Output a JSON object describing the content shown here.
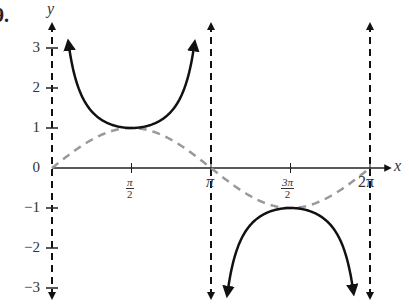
{
  "problem_label": "9.",
  "chart_data": {
    "type": "line",
    "title": "",
    "xlabel": "x",
    "ylabel": "y",
    "xlim": [
      0,
      6.2832
    ],
    "ylim": [
      -3,
      3
    ],
    "grid": false,
    "x_tick_labels": [
      "π/2",
      "π",
      "3π/2",
      "2π"
    ],
    "x_ticks": [
      1.5708,
      3.1416,
      4.7124,
      6.2832
    ],
    "y_tick_labels": [
      "-3",
      "-2",
      "-1",
      "0",
      "1",
      "2",
      "3"
    ],
    "y_ticks": [
      -3,
      -2,
      -1,
      0,
      1,
      2,
      3
    ],
    "series": [
      {
        "name": "y = csc x",
        "style": "solid black, arrows at ends",
        "branches": [
          {
            "x_range": [
              0.33,
              2.81
            ],
            "vertex": [
              1.5708,
              1
            ],
            "opens": "up"
          },
          {
            "x_range": [
              3.47,
              5.95
            ],
            "vertex": [
              4.7124,
              -1
            ],
            "opens": "down"
          }
        ]
      },
      {
        "name": "y = sin x",
        "style": "gray dashed",
        "points": [
          [
            0,
            0
          ],
          [
            1.5708,
            1
          ],
          [
            3.1416,
            0
          ],
          [
            4.7124,
            -1
          ],
          [
            6.2832,
            0
          ]
        ]
      }
    ],
    "asymptotes": [
      {
        "x": 0,
        "label": "x = 0"
      },
      {
        "x": 3.1416,
        "label": "x = π"
      },
      {
        "x": 6.2832,
        "label": "x = 2π"
      }
    ]
  },
  "labels": {
    "y_axis": "y",
    "x_axis": "x",
    "y3": "3",
    "y2": "2",
    "y1": "1",
    "y0": "0",
    "yn1": "−1",
    "yn2": "−2",
    "yn3": "−3",
    "pi_half_num": "π",
    "pi_half_den": "2",
    "pi": "π",
    "three_pi_half_num": "3π",
    "three_pi_half_den": "2",
    "two_pi": "2π"
  }
}
